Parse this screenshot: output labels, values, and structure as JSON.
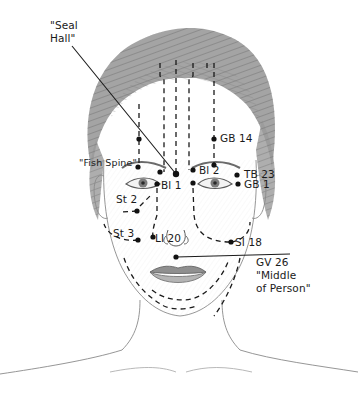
{
  "diagram": {
    "line_color": "#1a1a1a",
    "ink_color": "#1a1a1a",
    "sketch_color": "#8a8a8a"
  },
  "labels": {
    "seal_hall_line1": "\"Seal",
    "seal_hall_line2": "Hall\"",
    "gb14": "GB 14",
    "fish_spine": "\"Fish Spine\"",
    "bl2": "Bl 2",
    "tb23": "TB 23",
    "bl1": "Bl 1",
    "gb1": "GB 1",
    "st2": "St 2",
    "st3": "St 3",
    "li20": "LI 20",
    "si18": "SI 18",
    "gv26": "GV 26",
    "middle_of_person_line1": "\"Middle",
    "middle_of_person_line2": "of Person\""
  },
  "points": [
    {
      "id": "seal-hall",
      "name": "\"Seal Hall\"",
      "x": 176,
      "y": 174
    },
    {
      "id": "gb14-right",
      "name": "GB 14",
      "x": 214,
      "y": 139
    },
    {
      "id": "gb14-left",
      "name": "GB 14",
      "x": 139,
      "y": 139
    },
    {
      "id": "fish-spine",
      "name": "\"Fish Spine\"",
      "x": 138,
      "y": 167
    },
    {
      "id": "bl2-left",
      "name": "Bl 2",
      "x": 160,
      "y": 172
    },
    {
      "id": "bl2-right",
      "name": "Bl 2",
      "x": 193,
      "y": 170
    },
    {
      "id": "bl2-brow-right",
      "name": "Bl 2",
      "x": 214,
      "y": 165
    },
    {
      "id": "bl1-left",
      "name": "Bl 1",
      "x": 157,
      "y": 184
    },
    {
      "id": "bl1-right",
      "name": "Bl 1",
      "x": 193,
      "y": 183
    },
    {
      "id": "tb23",
      "name": "TB 23",
      "x": 237,
      "y": 175
    },
    {
      "id": "gb1",
      "name": "GB 1",
      "x": 238,
      "y": 184
    },
    {
      "id": "st2",
      "name": "St 2",
      "x": 137,
      "y": 211
    },
    {
      "id": "st3",
      "name": "St 3",
      "x": 138,
      "y": 240
    },
    {
      "id": "li20",
      "name": "LI 20",
      "x": 153,
      "y": 237
    },
    {
      "id": "si18",
      "name": "SI 18",
      "x": 231,
      "y": 242
    },
    {
      "id": "gv26",
      "name": "GV 26",
      "x": 176,
      "y": 257
    }
  ]
}
